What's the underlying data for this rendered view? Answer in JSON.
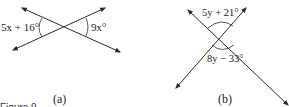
{
  "figure": {
    "caption": "Figure 9",
    "panels": [
      {
        "id": "a",
        "label": "(a)",
        "angle_left": "5x + 16°",
        "angle_right": "9x°"
      },
      {
        "id": "b",
        "label": "(b)",
        "angle_top": "5y + 21°",
        "angle_bottom": "8y − 33°"
      }
    ]
  },
  "colors": {
    "line": "#2a2a2a",
    "text": "#1a1a1a",
    "background": "#ffffff"
  }
}
